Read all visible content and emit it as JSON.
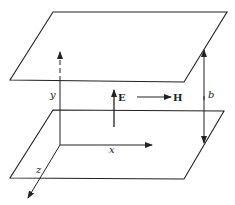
{
  "diagram": {
    "title": "",
    "colors": {
      "stroke": "#222222",
      "background": "#ffffff"
    },
    "planes": [
      {
        "id": "top-plate",
        "points": [
          [
            53,
            12
          ],
          [
            227,
            12
          ],
          [
            184,
            82
          ],
          [
            10,
            80
          ]
        ]
      },
      {
        "id": "bottom-plate",
        "points": [
          [
            53,
            110
          ],
          [
            224,
            111
          ],
          [
            184,
            179
          ],
          [
            10,
            178
          ]
        ]
      }
    ],
    "labels": {
      "y_axis": "y",
      "x_axis": "x",
      "z_axis": "z",
      "electric_field": "E",
      "magnetic_field": "H",
      "separation": "b"
    }
  }
}
